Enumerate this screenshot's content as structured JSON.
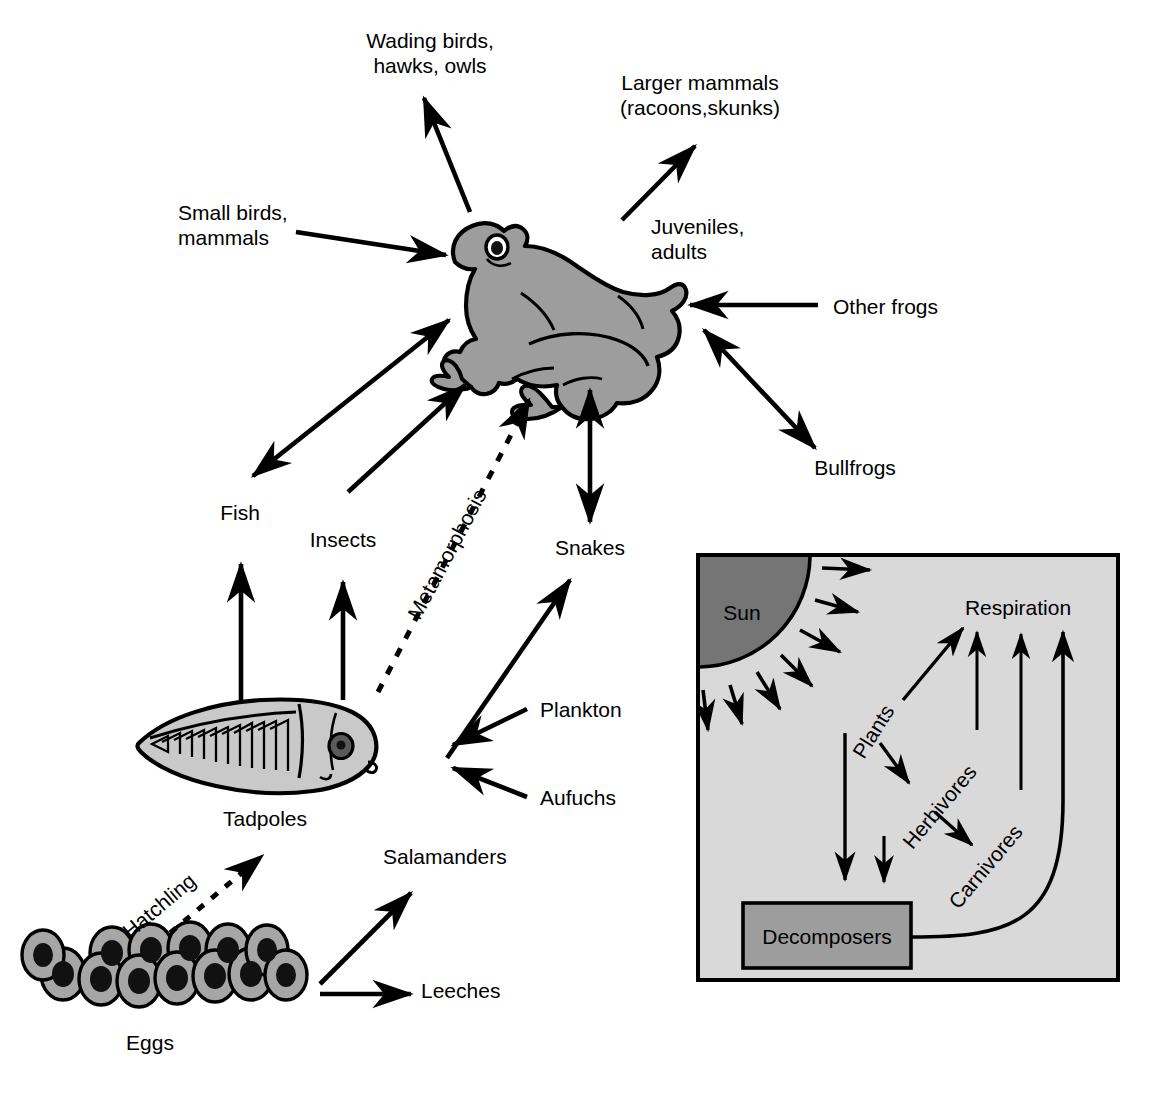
{
  "diagram": {
    "colors": {
      "body_fill": "#9d9d9d",
      "sun_fill": "#757575",
      "inset_bg": "#d9d9d9",
      "decomposer_fill": "#9d9d9d",
      "stroke": "#000000",
      "background": "#ffffff"
    },
    "labels": {
      "wading_birds": "Wading birds,\nhawks, owls",
      "larger_mammals": "Larger mammals\n(racoons,skunks)",
      "small_birds": "Small birds,\nmammals",
      "juveniles_adults": "Juveniles,\nadults",
      "other_frogs": "Other frogs",
      "bullfrogs": "Bullfrogs",
      "fish": "Fish",
      "insects": "Insects",
      "snakes": "Snakes",
      "metamorphosis": "Metamorphosis",
      "plankton": "Plankton",
      "aufuchs": "Aufuchs",
      "tadpoles": "Tadpoles",
      "hatchling": "Hatchling",
      "salamanders": "Salamanders",
      "leeches": "Leeches",
      "eggs": "Eggs"
    },
    "inset": {
      "sun": "Sun",
      "plants": "Plants",
      "herbivores": "Herbivores",
      "carnivores": "Carnivores",
      "respiration": "Respiration",
      "decomposers": "Decomposers"
    },
    "nodes": [
      {
        "id": "frog",
        "label": "Frog (juveniles, adults)",
        "kind": "illustration"
      },
      {
        "id": "tadpole",
        "label": "Tadpoles",
        "kind": "illustration"
      },
      {
        "id": "eggs",
        "label": "Eggs",
        "kind": "illustration"
      }
    ],
    "edges": [
      {
        "from": "frog",
        "to": "wading_birds",
        "style": "solid",
        "heads": "single"
      },
      {
        "from": "frog",
        "to": "larger_mammals",
        "style": "solid",
        "heads": "single"
      },
      {
        "from": "small_birds",
        "to": "frog",
        "style": "solid",
        "heads": "single"
      },
      {
        "from": "other_frogs",
        "to": "frog",
        "style": "solid",
        "heads": "single"
      },
      {
        "from": "frog",
        "to": "bullfrogs",
        "style": "solid",
        "heads": "double"
      },
      {
        "from": "frog",
        "to": "fish",
        "style": "solid",
        "heads": "double"
      },
      {
        "from": "insects",
        "to": "frog",
        "style": "solid",
        "heads": "single"
      },
      {
        "from": "frog",
        "to": "snakes",
        "style": "solid",
        "heads": "double"
      },
      {
        "from": "tadpole",
        "to": "frog",
        "style": "dashed",
        "heads": "single",
        "label": "Metamorphosis"
      },
      {
        "from": "tadpole",
        "to": "fish",
        "style": "solid",
        "heads": "single"
      },
      {
        "from": "tadpole",
        "to": "insects",
        "style": "solid",
        "heads": "single"
      },
      {
        "from": "tadpole",
        "to": "snakes",
        "style": "solid",
        "heads": "single"
      },
      {
        "from": "plankton",
        "to": "tadpole",
        "style": "solid",
        "heads": "single"
      },
      {
        "from": "aufuchs",
        "to": "tadpole",
        "style": "solid",
        "heads": "single"
      },
      {
        "from": "eggs",
        "to": "tadpole",
        "style": "dashed",
        "heads": "single",
        "label": "Hatchling"
      },
      {
        "from": "eggs",
        "to": "salamanders",
        "style": "solid",
        "heads": "single"
      },
      {
        "from": "eggs",
        "to": "leeches",
        "style": "solid",
        "heads": "single"
      }
    ],
    "inset_edges": [
      {
        "from": "sun",
        "to": "plants",
        "count": 7,
        "style": "solid"
      },
      {
        "from": "plants",
        "to": "respiration",
        "style": "solid"
      },
      {
        "from": "plants",
        "to": "herbivores",
        "style": "solid"
      },
      {
        "from": "herbivores",
        "to": "carnivores",
        "style": "solid"
      },
      {
        "from": "herbivores",
        "to": "respiration",
        "style": "solid"
      },
      {
        "from": "carnivores",
        "to": "respiration",
        "style": "solid"
      },
      {
        "from": "plants",
        "to": "decomposers",
        "style": "solid"
      },
      {
        "from": "herbivores",
        "to": "decomposers",
        "style": "solid"
      },
      {
        "from": "decomposers",
        "to": "respiration",
        "style": "curved"
      }
    ],
    "egg_count": 13
  }
}
